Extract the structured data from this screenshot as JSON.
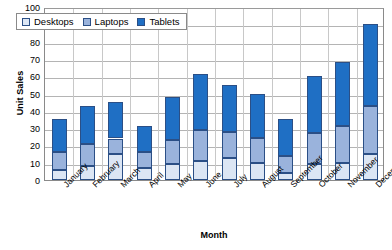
{
  "chart_data": {
    "type": "bar",
    "subtype": "stacked-column",
    "title": "",
    "xlabel": "Month",
    "ylabel": "Unit Sales",
    "ylim": [
      0,
      100
    ],
    "ytick_step": 10,
    "yticks": [
      0,
      10,
      20,
      30,
      40,
      50,
      60,
      70,
      80,
      90,
      100
    ],
    "ytick_labels": [
      "0",
      "10",
      "20",
      "30",
      "40",
      "50",
      "60",
      "70",
      "80",
      "90",
      "100"
    ],
    "categories": [
      "January",
      "February",
      "March",
      "April",
      "May",
      "June",
      "July",
      "August",
      "September",
      "October",
      "November",
      "December"
    ],
    "series": [
      {
        "name": "Desktops",
        "color": "#dce6f4",
        "values": [
          6,
          8,
          15,
          7,
          9,
          11,
          13,
          10,
          4,
          9,
          10,
          15
        ]
      },
      {
        "name": "Laptops",
        "color": "#9ab3dc",
        "values": [
          10,
          13,
          9,
          9,
          14,
          18,
          15,
          14,
          10,
          18,
          21,
          28
        ]
      },
      {
        "name": "Tablets",
        "color": "#1f6fc4",
        "values": [
          19,
          22,
          21,
          15,
          25,
          32,
          27,
          26,
          21,
          33,
          37,
          47
        ]
      }
    ],
    "totals": [
      35,
      43,
      45,
      31,
      48,
      61,
      55,
      50,
      35,
      60,
      68,
      90
    ],
    "grid": {
      "horizontal": true,
      "vertical": true,
      "color": "#b4b4b4"
    },
    "legend": {
      "position": "top-left-inside",
      "entries": [
        "Desktops",
        "Laptops",
        "Tablets"
      ]
    },
    "axis": {
      "border_color": "#8a8a8a",
      "bar_border_color": "#2b4f86"
    }
  }
}
